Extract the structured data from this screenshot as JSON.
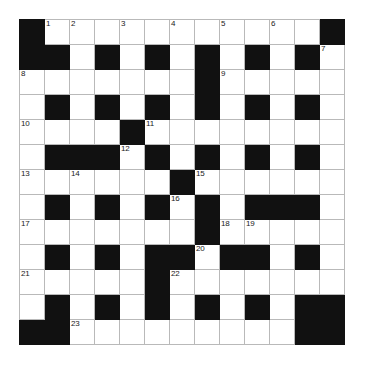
{
  "puzzle": {
    "type": "crossword-grid",
    "rows": 13,
    "cols": 13,
    "cell_size_px": 25,
    "colors": {
      "block": "#111111",
      "cell": "#ffffff",
      "cell_border": "#b9b9b9",
      "outer_border": "#3c3c3c",
      "number_text": "#1a1a1a"
    },
    "legend": {
      "0": "white (fillable) cell",
      "1": "black (blocked) cell"
    },
    "blocks": [
      [
        1,
        0,
        0,
        0,
        0,
        0,
        0,
        0,
        0,
        0,
        0,
        0,
        1
      ],
      [
        1,
        1,
        0,
        1,
        0,
        1,
        0,
        1,
        0,
        1,
        0,
        1,
        0
      ],
      [
        0,
        0,
        0,
        0,
        0,
        0,
        0,
        1,
        0,
        0,
        0,
        0,
        0
      ],
      [
        0,
        1,
        0,
        1,
        0,
        1,
        0,
        1,
        0,
        1,
        0,
        1,
        0
      ],
      [
        0,
        0,
        0,
        0,
        1,
        0,
        0,
        0,
        0,
        0,
        0,
        0,
        0
      ],
      [
        0,
        1,
        1,
        1,
        0,
        1,
        0,
        1,
        0,
        1,
        0,
        1,
        0
      ],
      [
        0,
        0,
        0,
        0,
        0,
        0,
        1,
        0,
        0,
        0,
        0,
        0,
        0
      ],
      [
        0,
        1,
        0,
        1,
        0,
        1,
        0,
        1,
        0,
        1,
        1,
        1,
        0
      ],
      [
        0,
        0,
        0,
        0,
        0,
        0,
        0,
        1,
        0,
        0,
        0,
        0,
        0
      ],
      [
        0,
        1,
        0,
        1,
        0,
        1,
        1,
        0,
        1,
        1,
        0,
        1,
        0
      ],
      [
        0,
        0,
        0,
        0,
        0,
        1,
        0,
        0,
        0,
        0,
        0,
        0,
        0
      ],
      [
        0,
        1,
        0,
        1,
        0,
        1,
        0,
        1,
        0,
        1,
        0,
        1,
        1
      ],
      [
        1,
        1,
        0,
        0,
        0,
        0,
        0,
        0,
        0,
        0,
        0,
        1,
        1
      ]
    ],
    "numbers": [
      {
        "n": "1",
        "row": 0,
        "col": 1
      },
      {
        "n": "2",
        "row": 0,
        "col": 2
      },
      {
        "n": "3",
        "row": 0,
        "col": 4
      },
      {
        "n": "4",
        "row": 0,
        "col": 6
      },
      {
        "n": "5",
        "row": 0,
        "col": 8
      },
      {
        "n": "6",
        "row": 0,
        "col": 10
      },
      {
        "n": "7",
        "row": 1,
        "col": 12
      },
      {
        "n": "8",
        "row": 2,
        "col": 0
      },
      {
        "n": "9",
        "row": 2,
        "col": 8
      },
      {
        "n": "10",
        "row": 4,
        "col": 0
      },
      {
        "n": "11",
        "row": 4,
        "col": 5
      },
      {
        "n": "12",
        "row": 5,
        "col": 4
      },
      {
        "n": "13",
        "row": 6,
        "col": 0
      },
      {
        "n": "14",
        "row": 6,
        "col": 2
      },
      {
        "n": "15",
        "row": 6,
        "col": 7
      },
      {
        "n": "16",
        "row": 7,
        "col": 6
      },
      {
        "n": "17",
        "row": 8,
        "col": 0
      },
      {
        "n": "18",
        "row": 8,
        "col": 8
      },
      {
        "n": "19",
        "row": 8,
        "col": 9
      },
      {
        "n": "20",
        "row": 9,
        "col": 7
      },
      {
        "n": "21",
        "row": 10,
        "col": 0
      },
      {
        "n": "22",
        "row": 10,
        "col": 6
      },
      {
        "n": "23",
        "row": 12,
        "col": 2
      }
    ]
  }
}
